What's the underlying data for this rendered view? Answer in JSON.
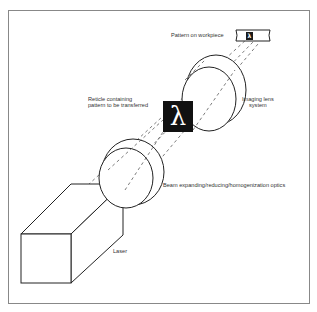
{
  "figure": {
    "type": "schematic",
    "frame": {
      "left": 8,
      "top": 10,
      "right": 310,
      "bottom": 304,
      "color": "#888888"
    }
  },
  "labels": {
    "pattern_on_workpiece": "Pattern on workpiece",
    "reticle_line1": "Reticle containing",
    "reticle_line2": "pattern to be transferred",
    "imaging_lens_line1": "Imaging lens",
    "imaging_lens_line2": "system",
    "beam_optics": "Beam expanding/reducing/homogenization optics",
    "laser": "Laser"
  },
  "symbols": {
    "reticle_glyph": "λ",
    "workpiece_glyph": "λ"
  },
  "colors": {
    "line": "#222222",
    "beam_dash": "#444444",
    "reticle_fill": "#111111",
    "text": "#333333"
  },
  "components": [
    {
      "id": "laser",
      "shape": "cuboid"
    },
    {
      "id": "beam-optics",
      "shape": "lens-pair"
    },
    {
      "id": "reticle",
      "shape": "square-with-glyph"
    },
    {
      "id": "imaging-lens",
      "shape": "lens-pair"
    },
    {
      "id": "workpiece",
      "shape": "strip-with-pattern"
    }
  ]
}
